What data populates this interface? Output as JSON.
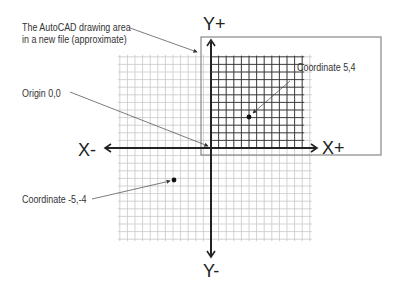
{
  "annotations": {
    "drawing_area_line1": "The AutoCAD drawing area",
    "drawing_area_line2": "in a new file (approximate)",
    "origin": "Origin 0,0",
    "coord_pos": "Coordinate 5,4",
    "coord_neg": "Coordinate -5,-4"
  },
  "axes": {
    "y_plus": "Y+",
    "y_minus": "Y-",
    "x_plus": "X+",
    "x_minus": "X-"
  },
  "colors": {
    "axis": "#222222",
    "grid_light": "#c8c8c8",
    "grid_dark": "#333333",
    "frame": "#888888"
  }
}
